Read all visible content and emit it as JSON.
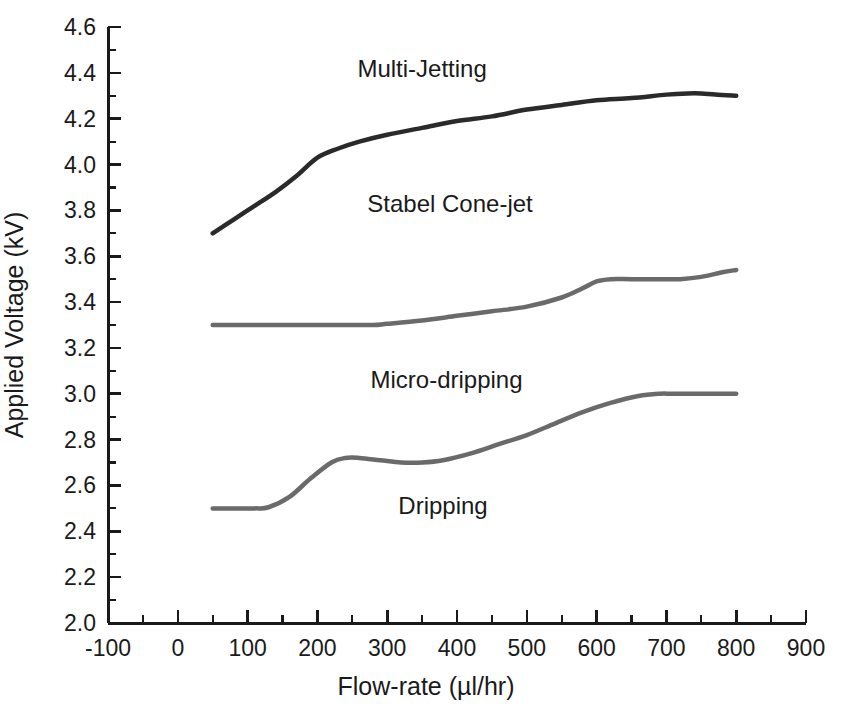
{
  "chart_data": {
    "type": "line",
    "title": "",
    "xlabel": "Flow-rate (µl/hr)",
    "ylabel": "Applied Voltage (kV)",
    "xlim": [
      -100,
      900
    ],
    "ylim": [
      2.0,
      4.6
    ],
    "xticks": [
      -100,
      0,
      100,
      200,
      300,
      400,
      500,
      600,
      700,
      800,
      900
    ],
    "xtick_labels": [
      "-100",
      "0",
      "100",
      "200",
      "300",
      "400",
      "500",
      "600",
      "700",
      "800",
      "900"
    ],
    "x_minor_tick_step": 50,
    "yticks": [
      2.0,
      2.2,
      2.4,
      2.6,
      2.8,
      3.0,
      3.2,
      3.4,
      3.6,
      3.8,
      4.0,
      4.2,
      4.4,
      4.6
    ],
    "ytick_labels": [
      "2.0",
      "2.2",
      "2.4",
      "2.6",
      "2.8",
      "3.0",
      "3.2",
      "3.4",
      "3.6",
      "3.8",
      "4.0",
      "4.2",
      "4.4",
      "4.6"
    ],
    "y_minor_tick_step": 0.1,
    "grid": false,
    "legend": "none",
    "series": [
      {
        "name": "Multi-Jetting boundary",
        "color": "#2a2a2a",
        "line_width": 4.5,
        "x": [
          50,
          80,
          110,
          140,
          170,
          200,
          230,
          260,
          300,
          350,
          400,
          450,
          500,
          550,
          600,
          650,
          700,
          730,
          750,
          770,
          800
        ],
        "values": [
          3.7,
          3.76,
          3.82,
          3.88,
          3.95,
          4.03,
          4.07,
          4.1,
          4.13,
          4.16,
          4.19,
          4.21,
          4.24,
          4.26,
          4.28,
          4.29,
          4.305,
          4.31,
          4.31,
          4.305,
          4.3
        ]
      },
      {
        "name": "Stabel Cone-jet boundary",
        "color": "#6a6a6a",
        "line_width": 4.5,
        "x": [
          50,
          100,
          150,
          200,
          250,
          280,
          300,
          350,
          400,
          450,
          500,
          550,
          580,
          600,
          620,
          650,
          700,
          720,
          750,
          780,
          800
        ],
        "values": [
          3.3,
          3.3,
          3.3,
          3.3,
          3.3,
          3.3,
          3.305,
          3.32,
          3.34,
          3.36,
          3.38,
          3.42,
          3.46,
          3.49,
          3.5,
          3.5,
          3.5,
          3.5,
          3.51,
          3.53,
          3.54
        ]
      },
      {
        "name": "Micro-dripping boundary",
        "color": "#6a6a6a",
        "line_width": 4.5,
        "x": [
          50,
          80,
          110,
          130,
          160,
          190,
          220,
          240,
          260,
          290,
          320,
          350,
          380,
          420,
          460,
          500,
          540,
          580,
          620,
          660,
          690,
          710,
          750,
          800
        ],
        "values": [
          2.5,
          2.5,
          2.5,
          2.505,
          2.55,
          2.63,
          2.7,
          2.72,
          2.72,
          2.71,
          2.7,
          2.7,
          2.71,
          2.74,
          2.78,
          2.82,
          2.87,
          2.92,
          2.96,
          2.99,
          3.0,
          3.0,
          3.0,
          3.0
        ]
      }
    ],
    "annotations": [
      {
        "text": "Multi-Jetting",
        "x": 350,
        "y": 4.41
      },
      {
        "text": "Stabel Cone-jet",
        "x": 390,
        "y": 3.82
      },
      {
        "text": "Micro-dripping",
        "x": 385,
        "y": 3.05
      },
      {
        "text": "Dripping",
        "x": 380,
        "y": 2.5
      }
    ]
  },
  "axis": {
    "x_title": "Flow-rate (µl/hr)",
    "y_title": "Applied Voltage (kV)"
  }
}
